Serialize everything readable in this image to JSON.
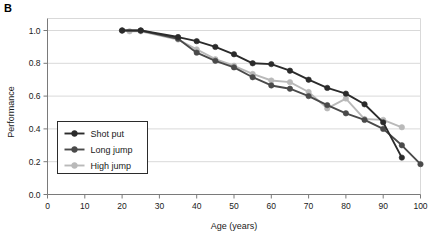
{
  "panel": {
    "label": "B"
  },
  "chart_data": {
    "type": "line",
    "title": "",
    "xlabel": "Age (years)",
    "ylabel": "Performance",
    "xlim": [
      0,
      100
    ],
    "ylim": [
      0.0,
      1.0
    ],
    "xticks": [
      0,
      10,
      20,
      30,
      40,
      50,
      60,
      70,
      80,
      90,
      100
    ],
    "xtick_labels": [
      "0",
      "10",
      "20",
      "30",
      "40",
      "50",
      "60",
      "70",
      "80",
      "90",
      "100"
    ],
    "yticks": [
      0.0,
      0.2,
      0.4,
      0.6,
      0.8,
      1.0
    ],
    "ytick_labels": [
      "0.0",
      "0.2",
      "0.4",
      "0.6",
      "0.8",
      "1.0"
    ],
    "grid": "horizontal",
    "legend_position": "lower-left-inside",
    "series": [
      {
        "name": "Shot put",
        "color": "#2b2b2b",
        "marker": "circle",
        "x": [
          20,
          25,
          35,
          40,
          45,
          50,
          55,
          60,
          65,
          70,
          75,
          80,
          85,
          90,
          95
        ],
        "y": [
          1.0,
          1.0,
          0.96,
          0.935,
          0.9,
          0.855,
          0.8,
          0.795,
          0.755,
          0.7,
          0.65,
          0.615,
          0.55,
          0.44,
          0.225
        ]
      },
      {
        "name": "Long jump",
        "color": "#4a4a4a",
        "marker": "circle",
        "x": [
          20,
          25,
          35,
          40,
          45,
          50,
          55,
          60,
          65,
          70,
          75,
          80,
          85,
          90,
          95,
          100
        ],
        "y": [
          1.0,
          1.0,
          0.95,
          0.865,
          0.815,
          0.775,
          0.715,
          0.665,
          0.645,
          0.6,
          0.545,
          0.495,
          0.455,
          0.4,
          0.3,
          0.185
        ]
      },
      {
        "name": "High jump",
        "color": "#b9b9b9",
        "marker": "circle",
        "x": [
          22,
          25,
          35,
          40,
          45,
          50,
          55,
          60,
          65,
          70,
          75,
          80,
          85,
          90,
          95
        ],
        "y": [
          0.995,
          0.995,
          0.945,
          0.885,
          0.825,
          0.785,
          0.735,
          0.695,
          0.685,
          0.625,
          0.525,
          0.585,
          0.46,
          0.455,
          0.41
        ]
      }
    ]
  },
  "legend": {
    "entries": [
      {
        "label": "Shot put"
      },
      {
        "label": "Long jump"
      },
      {
        "label": "High jump"
      }
    ]
  }
}
